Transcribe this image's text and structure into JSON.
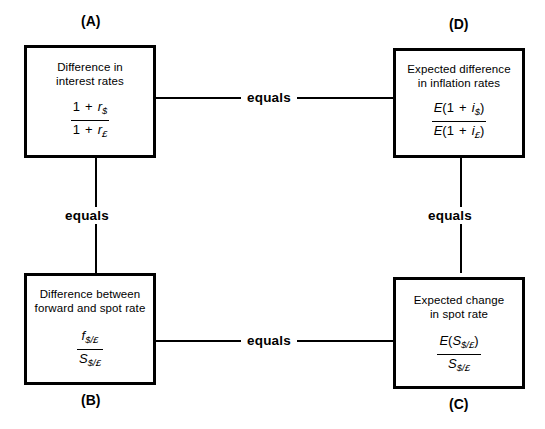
{
  "diagram": {
    "nodes": [
      {
        "id": "A",
        "letter": "(A)",
        "caption": "Difference in\ninterest rates",
        "numerator_plain": "1 + r$",
        "denominator_plain": "1 + r£"
      },
      {
        "id": "D",
        "letter": "(D)",
        "caption": "Expected  difference\nin inflation rates",
        "numerator_plain": "E(1 + i$)",
        "denominator_plain": "E(1 + i£)"
      },
      {
        "id": "B",
        "letter": "(B)",
        "caption": "Difference between\nforward and spot rate",
        "numerator_plain": "f$/£",
        "denominator_plain": "S$/£"
      },
      {
        "id": "C",
        "letter": "(C)",
        "caption": "Expected  change\nin spot rate",
        "numerator_plain": "E(S$/£)",
        "denominator_plain": "S$/£"
      }
    ],
    "connectors": [
      {
        "id": "A-D",
        "label": "equals",
        "from": "A",
        "to": "D",
        "orientation": "horizontal"
      },
      {
        "id": "A-B",
        "label": "equals",
        "from": "A",
        "to": "B",
        "orientation": "vertical"
      },
      {
        "id": "D-C",
        "label": "equals",
        "from": "D",
        "to": "C",
        "orientation": "vertical"
      },
      {
        "id": "B-C",
        "label": "equals",
        "from": "B",
        "to": "C",
        "orientation": "horizontal"
      }
    ],
    "colors": {
      "background": "#ffffff",
      "stroke": "#000000",
      "text": "#000000"
    }
  }
}
